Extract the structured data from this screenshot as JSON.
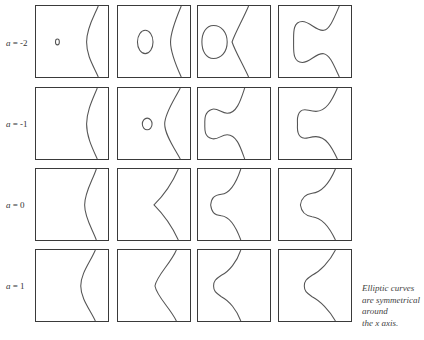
{
  "figure": {
    "row_labels": [
      {
        "var": "a",
        "text": " = -2"
      },
      {
        "var": "a",
        "text": " = -1"
      },
      {
        "var": "a",
        "text": " = 0"
      },
      {
        "var": "a",
        "text": " = 1"
      }
    ],
    "caption_lines": [
      "Elliptic curves",
      "are symmetrical",
      "around",
      "the x axis."
    ],
    "grid": {
      "rows": 4,
      "columns": 4
    },
    "stroke_color": "#555555",
    "border_color": "#3a3a3a"
  }
}
